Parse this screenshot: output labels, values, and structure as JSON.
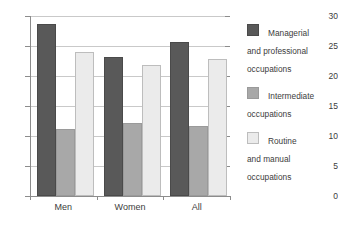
{
  "chart_data": {
    "type": "bar",
    "title": "",
    "subtitle": "",
    "xlabel": "",
    "ylabel": "",
    "categories": [
      "Men",
      "Women",
      "All"
    ],
    "series": [
      {
        "name": "Managerial\nand professional\noccupations",
        "color": "#595959",
        "border": "#4a4a4a",
        "values": [
          28.6,
          23.1,
          25.7
        ]
      },
      {
        "name": "Intermediate\noccupations",
        "color": "#a8a8a8",
        "border": "#9a9a9a",
        "values": [
          11.1,
          12.1,
          11.6
        ]
      },
      {
        "name": "Routine\nand manual\noccupations",
        "color": "#ebebeb",
        "border": "#bdbdbd",
        "values": [
          24.0,
          21.8,
          22.8
        ]
      }
    ],
    "ylim": [
      0,
      30
    ],
    "yticks": [
      0,
      5,
      10,
      15,
      20,
      25,
      30
    ],
    "ytick_labels": [
      "0",
      "5",
      "10",
      "15",
      "20",
      "25",
      "30"
    ],
    "grid": true,
    "legend_position": "right"
  },
  "axes": {
    "y_tick_labels": [
      "30",
      "25",
      "20",
      "15",
      "10",
      "5",
      "0"
    ],
    "x_tick_labels": [
      "Men",
      "Women",
      "All"
    ]
  },
  "legend": {
    "items": [
      {
        "label": "Managerial\nand professional\noccupations",
        "swatch_name": "legend-swatch-managerial"
      },
      {
        "label": "Intermediate\noccupations",
        "swatch_name": "legend-swatch-intermediate"
      },
      {
        "label": "Routine\nand manual\noccupations",
        "swatch_name": "legend-swatch-routine"
      }
    ]
  }
}
